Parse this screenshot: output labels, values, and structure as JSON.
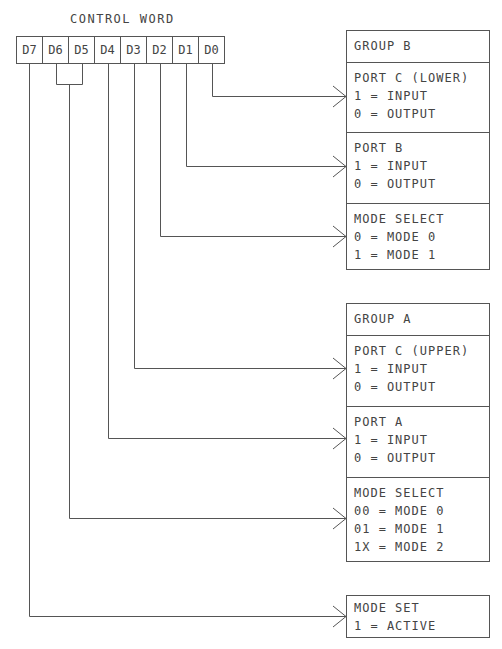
{
  "diagram": {
    "title": "CONTROL WORD",
    "bits": [
      "D7",
      "D6",
      "D5",
      "D4",
      "D3",
      "D2",
      "D1",
      "D0"
    ],
    "group_b": {
      "header": "GROUP B",
      "sections": [
        {
          "title": "PORT C (LOWER)",
          "lines": [
            "1 = INPUT",
            "0 = OUTPUT"
          ],
          "source_bit": "D0"
        },
        {
          "title": "PORT B",
          "lines": [
            "1 = INPUT",
            "0 = OUTPUT"
          ],
          "source_bit": "D1"
        },
        {
          "title": "MODE SELECT",
          "lines": [
            "0 = MODE 0",
            "1 = MODE 1"
          ],
          "source_bit": "D2"
        }
      ]
    },
    "group_a": {
      "header": "GROUP A",
      "sections": [
        {
          "title": "PORT C (UPPER)",
          "lines": [
            "1 = INPUT",
            "0 = OUTPUT"
          ],
          "source_bit": "D3"
        },
        {
          "title": "PORT A",
          "lines": [
            "1 = INPUT",
            "0 = OUTPUT"
          ],
          "source_bit": "D4"
        },
        {
          "title": "MODE SELECT",
          "lines": [
            "00 = MODE 0",
            "01 = MODE 1",
            "1X = MODE 2"
          ],
          "source_bit": "D6-D5"
        }
      ]
    },
    "mode_set": {
      "title": "MODE SET",
      "lines": [
        "1 = ACTIVE"
      ],
      "source_bit": "D7"
    },
    "colors": {
      "line": "#555555",
      "text": "#444444",
      "background": "#ffffff"
    }
  }
}
